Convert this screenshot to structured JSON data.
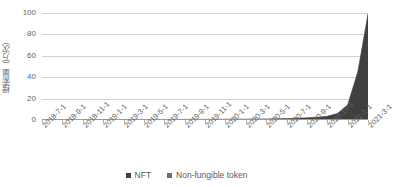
{
  "chart_data": {
    "type": "area",
    "title": "",
    "xlabel": "",
    "ylabel": "搜索量（万次）",
    "ylim": [
      0,
      100
    ],
    "yticks": [
      0,
      20,
      40,
      60,
      80,
      100
    ],
    "ytick_labels": [
      "0",
      "20",
      "40",
      "60",
      "80",
      "100"
    ],
    "grid": true,
    "legend_position": "bottom-center",
    "categories": [
      "2018-7-1",
      "2018-9-1",
      "2018-11-1",
      "2019-1-1",
      "2019-3-1",
      "2019-5-1",
      "2019-7-1",
      "2019-9-1",
      "2019-11-1",
      "2020-1-1",
      "2020-3-1",
      "2020-5-1",
      "2020-7-1",
      "2020-9-1",
      "2020-11-1",
      "2021-1-1",
      "2021-3-1"
    ],
    "series": [
      {
        "name": "NFT",
        "color": "#404040",
        "x": [
          "2018-7-1",
          "2018-8-1",
          "2018-9-1",
          "2018-10-1",
          "2018-11-1",
          "2018-12-1",
          "2019-1-1",
          "2019-2-1",
          "2019-3-1",
          "2019-4-1",
          "2019-5-1",
          "2019-6-1",
          "2019-7-1",
          "2019-8-1",
          "2019-9-1",
          "2019-10-1",
          "2019-11-1",
          "2019-12-1",
          "2020-1-1",
          "2020-2-1",
          "2020-3-1",
          "2020-4-1",
          "2020-5-1",
          "2020-6-1",
          "2020-7-1",
          "2020-8-1",
          "2020-9-1",
          "2020-10-1",
          "2020-11-1",
          "2020-12-1",
          "2021-1-1",
          "2021-2-1",
          "2021-3-1"
        ],
        "values": [
          0.2,
          0.2,
          0.3,
          0.3,
          0.3,
          0.3,
          0.4,
          0.4,
          0.4,
          0.4,
          0.5,
          0.5,
          0.5,
          0.5,
          0.6,
          0.6,
          0.6,
          0.7,
          0.7,
          0.8,
          0.8,
          0.9,
          1.0,
          1.1,
          1.3,
          1.6,
          2.0,
          2.6,
          3.6,
          6.0,
          14.0,
          45.0,
          99.0
        ]
      },
      {
        "name": "Non-fungible token",
        "color": "#6e6e6e",
        "x": [
          "2018-7-1",
          "2018-8-1",
          "2018-9-1",
          "2018-10-1",
          "2018-11-1",
          "2018-12-1",
          "2019-1-1",
          "2019-2-1",
          "2019-3-1",
          "2019-4-1",
          "2019-5-1",
          "2019-6-1",
          "2019-7-1",
          "2019-8-1",
          "2019-9-1",
          "2019-10-1",
          "2019-11-1",
          "2019-12-1",
          "2020-1-1",
          "2020-2-1",
          "2020-3-1",
          "2020-4-1",
          "2020-5-1",
          "2020-6-1",
          "2020-7-1",
          "2020-8-1",
          "2020-9-1",
          "2020-10-1",
          "2020-11-1",
          "2020-12-1",
          "2021-1-1",
          "2021-2-1",
          "2021-3-1"
        ],
        "values": [
          0.1,
          0.1,
          0.1,
          0.1,
          0.1,
          0.1,
          0.1,
          0.1,
          0.1,
          0.1,
          0.1,
          0.1,
          0.2,
          0.2,
          0.2,
          0.2,
          0.2,
          0.2,
          0.2,
          0.2,
          0.2,
          0.2,
          0.2,
          0.3,
          0.3,
          0.3,
          0.4,
          0.5,
          0.7,
          1.0,
          2.0,
          6.0,
          13.0
        ]
      }
    ]
  },
  "legend": {
    "items": [
      {
        "label": "NFT",
        "color": "#404040"
      },
      {
        "label": "Non-fungible token",
        "color": "#6e6e6e"
      }
    ]
  },
  "colors": {
    "gridline": "#d0d0d0",
    "axis": "#9a9a9a",
    "text": "#636363",
    "background": "#ffffff"
  }
}
